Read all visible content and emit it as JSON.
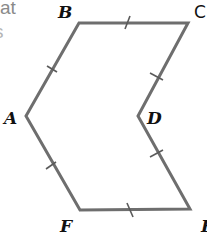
{
  "diagram": {
    "type": "geometry-figure",
    "text_fragment": "at",
    "text_fragment_2": "s",
    "colors": {
      "edge": "#6e6e6e",
      "label": "#111111",
      "fragment": "#8a8a8a",
      "background": "#ffffff"
    },
    "vertices": [
      {
        "name": "A",
        "x": 26,
        "y": 116,
        "label": "A"
      },
      {
        "name": "B",
        "x": 79,
        "y": 23,
        "label": "B"
      },
      {
        "name": "C",
        "x": 188,
        "y": 23,
        "label": "C"
      },
      {
        "name": "D",
        "x": 138,
        "y": 116,
        "label": "D"
      },
      {
        "name": "E",
        "x": 190,
        "y": 209,
        "label": "E"
      },
      {
        "name": "F",
        "x": 80,
        "y": 210,
        "label": "F"
      }
    ],
    "edges": [
      {
        "from": "A",
        "to": "B",
        "tick_marks": 1
      },
      {
        "from": "B",
        "to": "C",
        "tick_marks": 1
      },
      {
        "from": "C",
        "to": "D",
        "tick_marks": 1
      },
      {
        "from": "D",
        "to": "E",
        "tick_marks": 1
      },
      {
        "from": "E",
        "to": "F",
        "tick_marks": 1
      },
      {
        "from": "F",
        "to": "A",
        "tick_marks": 1
      }
    ],
    "labels": {
      "A": "A",
      "B": "B",
      "C": "C",
      "D": "D",
      "E": "E",
      "F": "F"
    }
  }
}
